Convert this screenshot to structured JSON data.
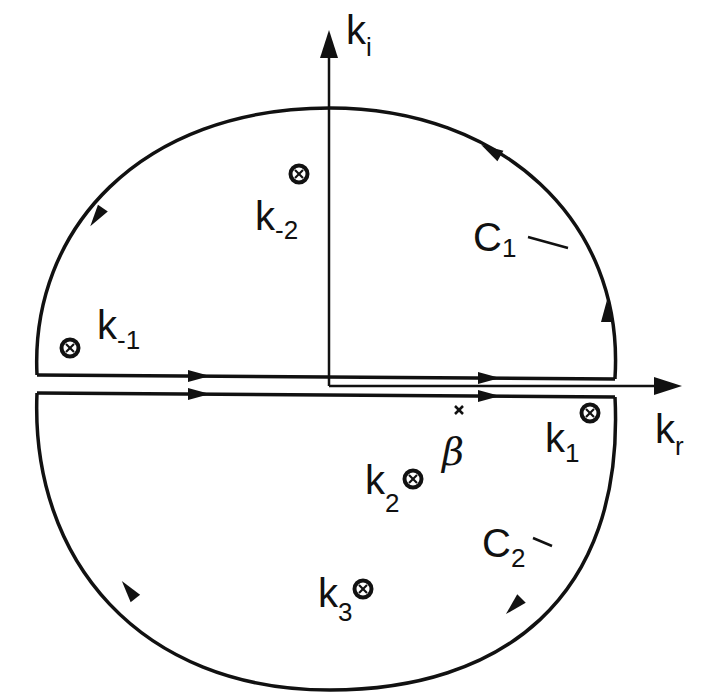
{
  "figure": {
    "axes": {
      "imaginary": {
        "label_main": "k",
        "label_sub": "i"
      },
      "real": {
        "label_main": "k",
        "label_sub": "r"
      }
    },
    "contours": [
      {
        "id": "C1",
        "label_main": "C",
        "label_sub": "1",
        "region": "upper",
        "direction": "counter-clockwise"
      },
      {
        "id": "C2",
        "label_main": "C",
        "label_sub": "2",
        "region": "lower",
        "direction": "clockwise"
      }
    ],
    "poles": [
      {
        "id": "k-2",
        "label_main": "k",
        "label_sub": "-2",
        "symbol": "circled-cross"
      },
      {
        "id": "k-1",
        "label_main": "k",
        "label_sub": "-1",
        "symbol": "circled-cross"
      },
      {
        "id": "k1",
        "label_main": "k",
        "label_sub": "1",
        "symbol": "circled-cross"
      },
      {
        "id": "k2",
        "label_main": "k",
        "label_sub": "2",
        "symbol": "circled-cross"
      },
      {
        "id": "k3",
        "label_main": "k",
        "label_sub": "3",
        "symbol": "circled-cross"
      }
    ],
    "points": [
      {
        "id": "beta",
        "label": "β",
        "symbol": "x"
      }
    ],
    "colors": {
      "ink": "#111111",
      "background": "#ffffff"
    }
  }
}
